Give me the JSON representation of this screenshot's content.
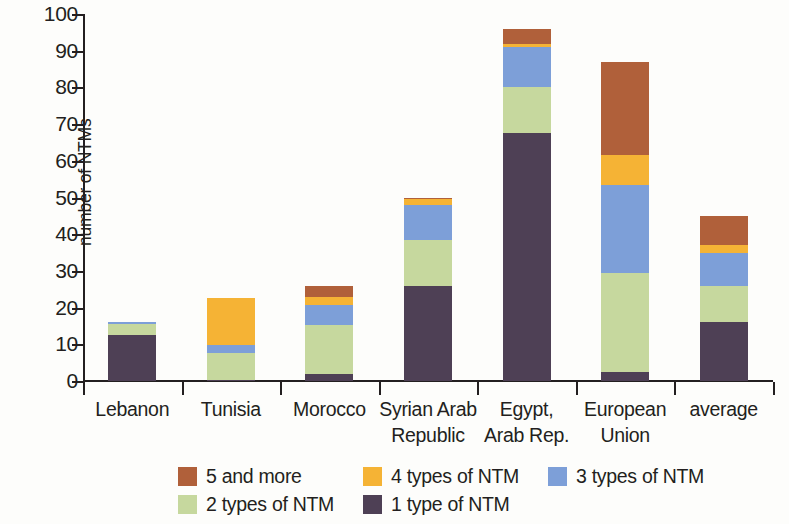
{
  "chart_data": {
    "type": "bar",
    "subtype": "stacked-bar",
    "title": "",
    "xlabel": "",
    "ylabel": "number of NTMs",
    "ylim": [
      0,
      100
    ],
    "yticks": [
      0,
      10,
      20,
      30,
      40,
      50,
      60,
      70,
      80,
      90,
      100
    ],
    "grid": false,
    "legend_position": "bottom",
    "categories": [
      "Lebanon",
      "Tunisia",
      "Morocco",
      "Syrian Arab Republic",
      "Egypt, Arab Rep.",
      "European Union",
      "average"
    ],
    "category_lines": [
      [
        "Lebanon"
      ],
      [
        "Tunisia"
      ],
      [
        "Morocco"
      ],
      [
        "Syrian Arab",
        "Republic"
      ],
      [
        "Egypt,",
        "Arab Rep."
      ],
      [
        "European",
        "Union"
      ],
      [
        "average"
      ]
    ],
    "series": [
      {
        "name": "1 type of NTM",
        "color": "#4e4055",
        "values": [
          12.5,
          0.3,
          1.8,
          26,
          67.5,
          2.5,
          16
        ]
      },
      {
        "name": "2 types of NTM",
        "color": "#c6d89e",
        "values": [
          3,
          7.2,
          13.5,
          12.5,
          12.5,
          27,
          10
        ]
      },
      {
        "name": "3 types of NTM",
        "color": "#7d9fd8",
        "values": [
          0.7,
          2.2,
          5.5,
          9.5,
          11,
          24,
          9
        ]
      },
      {
        "name": "4 types of NTM",
        "color": "#f5b335",
        "values": [
          0,
          13,
          2,
          1.5,
          0.7,
          8,
          2
        ]
      },
      {
        "name": "5 and more",
        "color": "#b0603a",
        "values": [
          0,
          0,
          3.2,
          0.5,
          4.3,
          25.5,
          8
        ]
      }
    ],
    "totals": [
      16.2,
      22.7,
      26,
      50,
      96,
      87,
      45
    ],
    "legend_entries": [
      {
        "label": "5 and more",
        "color": "#b0603a"
      },
      {
        "label": "4 types of NTM",
        "color": "#f5b335"
      },
      {
        "label": "3 types of NTM",
        "color": "#7d9fd8"
      },
      {
        "label": "2 types of NTM",
        "color": "#c6d89e"
      },
      {
        "label": "1 type of NTM",
        "color": "#4e4055"
      }
    ]
  }
}
